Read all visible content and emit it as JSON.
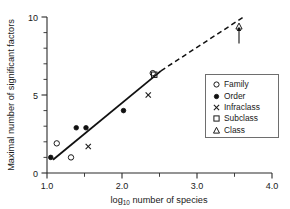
{
  "chart_data": {
    "type": "scatter",
    "title": "",
    "xlabel": "log10 number of species",
    "xlabel_base": "log",
    "xlabel_sub": "10",
    "xlabel_rest": " number of species",
    "ylabel": "Maximal number of significant factors",
    "xlim": [
      1.0,
      4.0
    ],
    "ylim": [
      0,
      10
    ],
    "xticks": [
      1.0,
      2.0,
      3.0,
      4.0
    ],
    "xtick_labels": [
      "1.0",
      "2.0",
      "3.0",
      "4.0"
    ],
    "xtick_minor": [
      1.5,
      2.5,
      3.5
    ],
    "yticks": [
      0,
      5,
      10
    ],
    "ytick_labels": [
      "0",
      "5",
      "10"
    ],
    "ytick_minor": [
      1,
      2,
      3,
      4,
      6,
      7,
      8,
      9
    ],
    "grid": false,
    "legend_position": "right",
    "series": [
      {
        "name": "Family",
        "marker": "open-circle",
        "points": [
          {
            "x": 1.13,
            "y": 1.9
          },
          {
            "x": 1.32,
            "y": 1.0
          },
          {
            "x": 2.41,
            "y": 6.4
          }
        ]
      },
      {
        "name": "Order",
        "marker": "filled-circle",
        "points": [
          {
            "x": 1.05,
            "y": 1.0
          },
          {
            "x": 1.39,
            "y": 2.9
          },
          {
            "x": 1.52,
            "y": 2.9
          },
          {
            "x": 2.02,
            "y": 4.0
          }
        ]
      },
      {
        "name": "Infraclass",
        "marker": "cross",
        "points": [
          {
            "x": 1.55,
            "y": 1.7
          },
          {
            "x": 2.35,
            "y": 5.0
          }
        ]
      },
      {
        "name": "Subclass",
        "marker": "open-square",
        "points": [
          {
            "x": 2.43,
            "y": 6.3
          }
        ]
      },
      {
        "name": "Class",
        "marker": "open-triangle",
        "points": [
          {
            "x": 3.56,
            "y": 9.4
          }
        ]
      }
    ],
    "fit_line": {
      "x0": 1.08,
      "y0": 0.85,
      "x1": 2.52,
      "y1": 6.55,
      "style": "solid"
    },
    "extrapolation_line": {
      "x0": 2.52,
      "y0": 6.55,
      "x1": 3.62,
      "y1": 10.0,
      "style": "dashed"
    },
    "annotation_arrow": {
      "x": 3.56,
      "y_from": 8.3,
      "y_to": 9.3,
      "direction": "up"
    }
  },
  "legend": {
    "entries": [
      {
        "label": "Family",
        "marker": "open-circle"
      },
      {
        "label": "Order",
        "marker": "filled-circle"
      },
      {
        "label": "Infraclass",
        "marker": "cross"
      },
      {
        "label": "Subclass",
        "marker": "open-square"
      },
      {
        "label": "Class",
        "marker": "open-triangle"
      }
    ]
  }
}
